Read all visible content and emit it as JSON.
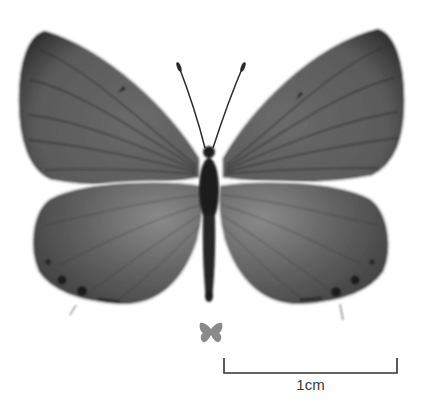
{
  "image": {
    "subject": "butterfly specimen, dorsal view",
    "colors": {
      "wing": "#5e5e5e",
      "wing_dark_border": "#2e2e2e",
      "body": "#1e1e1e",
      "fringe": "#f4f4f4",
      "size_icon": "#8a8a8a",
      "scale_bar": "#333333"
    }
  },
  "scale": {
    "label": "1cm"
  },
  "icons": {
    "size_reference": "butterfly-silhouette-icon"
  }
}
